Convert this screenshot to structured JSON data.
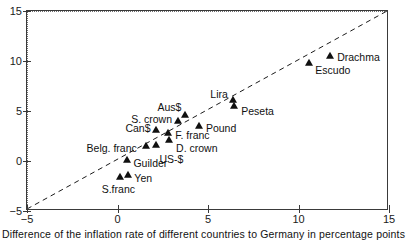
{
  "chart_data": {
    "type": "scatter",
    "title": "",
    "subtitle": "",
    "xlabel": "Difference of the inflation rate of different countries to Germany in percentage points",
    "ylabel": "",
    "xlim": [
      -5,
      15
    ],
    "ylim": [
      -5,
      15
    ],
    "xticks": [
      "-5",
      "0",
      "5",
      "10",
      "15"
    ],
    "xtick_values": [
      -5,
      0,
      5,
      10,
      15
    ],
    "yticks": [
      "-5",
      "0",
      "5",
      "10",
      "15"
    ],
    "ytick_values": [
      -5,
      0,
      5,
      10,
      15
    ],
    "grid": "zero-lines-only-dotted",
    "legend": "none",
    "annotations": [
      {
        "name": "diagonal-reference-line",
        "style": "dashed",
        "from": [
          -5,
          -5
        ],
        "to": [
          15,
          15
        ],
        "description": "45 degree line"
      }
    ],
    "points": [
      {
        "label": "S.franc",
        "x": 0.15,
        "y": -1.6,
        "label_dx": -2,
        "label_dy": 12,
        "label_anchor": "middle"
      },
      {
        "label": "Yen",
        "x": 0.6,
        "y": -1.4,
        "label_dx": 6,
        "label_dy": 3,
        "label_anchor": "start"
      },
      {
        "label": "Guilder",
        "x": 0.55,
        "y": 0.15,
        "label_dx": 6,
        "label_dy": 3,
        "label_anchor": "start"
      },
      {
        "label": "Belg. franc",
        "x": 1.55,
        "y": 1.5,
        "label_dx": -9,
        "label_dy": 2,
        "label_anchor": "end"
      },
      {
        "label": "US-$",
        "x": 2.15,
        "y": 1.65,
        "label_dx": 3,
        "label_dy": 14,
        "label_anchor": "start"
      },
      {
        "label": "Can$",
        "x": 2.15,
        "y": 3.1,
        "label_dx": -6,
        "label_dy": -2,
        "label_anchor": "end"
      },
      {
        "label": "D. crown",
        "x": 2.85,
        "y": 2.15,
        "label_dx": 7,
        "label_dy": 8,
        "label_anchor": "start"
      },
      {
        "label": "F. franc",
        "x": 2.8,
        "y": 2.85,
        "label_dx": 7,
        "label_dy": 2,
        "label_anchor": "start"
      },
      {
        "label": "S. crown",
        "x": 3.35,
        "y": 4.05,
        "label_dx": -6,
        "label_dy": -2,
        "label_anchor": "end"
      },
      {
        "label": "Aus$",
        "x": 3.75,
        "y": 4.6,
        "label_dx": -4,
        "label_dy": -8,
        "label_anchor": "end"
      },
      {
        "label": "Pound",
        "x": 4.5,
        "y": 3.55,
        "label_dx": 7,
        "label_dy": 2,
        "label_anchor": "start"
      },
      {
        "label": "Peseta",
        "x": 6.45,
        "y": 5.5,
        "label_dx": 7,
        "label_dy": 5,
        "label_anchor": "start"
      },
      {
        "label": "Lira",
        "x": 6.4,
        "y": 6.15,
        "label_dx": -5,
        "label_dy": -6,
        "label_anchor": "end"
      },
      {
        "label": "Escudo",
        "x": 10.6,
        "y": 9.85,
        "label_dx": 6,
        "label_dy": 7,
        "label_anchor": "start"
      },
      {
        "label": "Drachma",
        "x": 11.75,
        "y": 10.55,
        "label_dx": 7,
        "label_dy": 1,
        "label_anchor": "start"
      }
    ]
  },
  "caption": {
    "text": "Difference of the inflation rate of different countries to Germany in percentage points"
  },
  "colors": {
    "marker": "#101010",
    "axis": "#3a3a3a",
    "grid": "#6e6e6e",
    "text": "#111111",
    "background": "#ffffff"
  }
}
